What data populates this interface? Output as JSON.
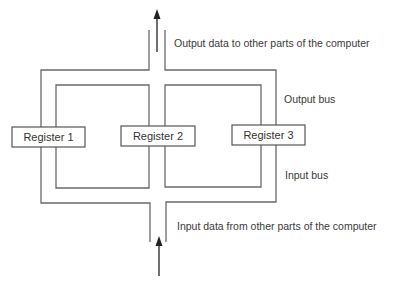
{
  "diagram": {
    "output_caption": "Output data to other parts of the computer",
    "output_bus_label": "Output bus",
    "input_bus_label": "Input bus",
    "input_caption": "Input data from other parts of the computer",
    "registers": [
      {
        "label": "Register 1"
      },
      {
        "label": "Register 2"
      },
      {
        "label": "Register 3"
      }
    ]
  }
}
